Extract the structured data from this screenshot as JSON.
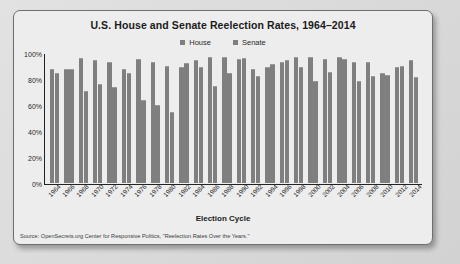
{
  "chart_data": {
    "type": "bar",
    "title": "U.S. House and Senate Reelection Rates, 1964–2014",
    "xlabel": "Election Cycle",
    "ylabel": "",
    "ylim": [
      0,
      100
    ],
    "ytick_labels": [
      "100%",
      "80%",
      "60%",
      "40%",
      "20%",
      "0%"
    ],
    "ytick_values": [
      100,
      80,
      60,
      40,
      20,
      0
    ],
    "grid": false,
    "legend_position": "top-center",
    "series_color": "#7f7f7f",
    "categories": [
      "1964",
      "1966",
      "1968",
      "1970",
      "1972",
      "1974",
      "1976",
      "1978",
      "1980",
      "1982",
      "1984",
      "1986",
      "1988",
      "1990",
      "1992",
      "1994",
      "1996",
      "1998",
      "2000",
      "2002",
      "2004",
      "2006",
      "2008",
      "2010",
      "2012",
      "2014"
    ],
    "series": [
      {
        "name": "House",
        "color": "#7f7f7f",
        "values": [
          88,
          88,
          97,
          95,
          94,
          88,
          96,
          94,
          91,
          90,
          95,
          98,
          98,
          96,
          88,
          90,
          94,
          98,
          98,
          96,
          98,
          94,
          94,
          85,
          90,
          95
        ]
      },
      {
        "name": "Senate",
        "color": "#7f7f7f",
        "values": [
          85,
          88,
          71,
          77,
          74,
          85,
          64,
          60,
          55,
          93,
          90,
          75,
          85,
          97,
          83,
          92,
          95,
          90,
          79,
          86,
          96,
          79,
          83,
          84,
          91,
          82
        ]
      }
    ],
    "source": "Source: OpenSecrets.org Center for Responsive Politics, \"Reelection Rates Over the Years.\""
  }
}
